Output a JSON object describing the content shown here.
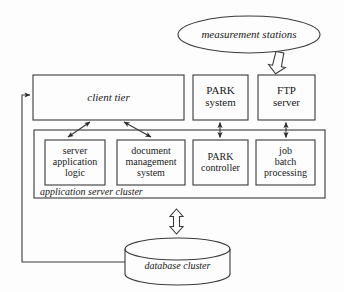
{
  "diagram": {
    "style": {
      "background": "#fdfdfd",
      "stroke": "#3a3a3a",
      "text": "#1a1a1a",
      "fill": "none"
    },
    "nodes": [
      {
        "id": "measurement-stations",
        "label": "measurement  stations",
        "shape": "ellipse",
        "italic": true,
        "x": 178,
        "y": 16,
        "w": 142,
        "h": 37
      },
      {
        "id": "client-tier",
        "label": "client tier",
        "shape": "rect",
        "italic": true,
        "x": 33,
        "y": 75,
        "w": 151,
        "h": 45
      },
      {
        "id": "park-system",
        "label": "PARK\nsystem",
        "line1": "PARK",
        "line2": "system",
        "shape": "rect",
        "italic": false,
        "x": 193,
        "y": 75,
        "w": 55,
        "h": 45
      },
      {
        "id": "ftp-server",
        "label": "FTP\nserver",
        "line1": "FTP",
        "line2": "server",
        "shape": "rect",
        "italic": false,
        "x": 258,
        "y": 75,
        "w": 57,
        "h": 45
      },
      {
        "id": "application-server-cluster",
        "label": "application server cluster",
        "shape": "rect",
        "italic": true,
        "x": 34,
        "y": 130,
        "w": 291,
        "h": 68
      },
      {
        "id": "server-application-logic",
        "label": "server application logic",
        "line1": "server",
        "line2": "application",
        "line3": "logic",
        "shape": "rect",
        "italic": false,
        "x": 45,
        "y": 140,
        "w": 60,
        "h": 45
      },
      {
        "id": "document-management-system",
        "label": "document management system",
        "line1": "document",
        "line2": "management",
        "line3": "system",
        "shape": "rect",
        "italic": false,
        "x": 117,
        "y": 140,
        "w": 68,
        "h": 45
      },
      {
        "id": "park-controller",
        "label": "PARK controller",
        "line1": "PARK",
        "line2": "controller",
        "shape": "rect",
        "italic": false,
        "x": 193,
        "y": 140,
        "w": 55,
        "h": 45
      },
      {
        "id": "job-batch-processing",
        "label": "job batch processing",
        "line1": "job",
        "line2": "batch",
        "line3": "processing",
        "shape": "rect",
        "italic": false,
        "x": 256,
        "y": 140,
        "w": 59,
        "h": 45
      },
      {
        "id": "database-cluster",
        "label": "database cluster",
        "shape": "cylinder",
        "italic": true,
        "x": 125,
        "y": 238,
        "w": 105,
        "h": 47
      }
    ],
    "connectors": [
      {
        "id": "stations-to-ftp",
        "type": "block-arrow",
        "direction": "down",
        "from": "measurement-stations",
        "to": "ftp-server"
      },
      {
        "id": "cluster-to-database",
        "type": "block-arrow",
        "direction": "both",
        "from": "application-server-cluster",
        "to": "database-cluster"
      },
      {
        "id": "client-to-server-logic",
        "type": "line-arrow",
        "direction": "both",
        "from": "client-tier",
        "to": "server-application-logic"
      },
      {
        "id": "client-to-document-management",
        "type": "line-arrow",
        "direction": "both",
        "from": "client-tier",
        "to": "document-management-system"
      },
      {
        "id": "park-system-to-park-controller",
        "type": "line-arrow",
        "direction": "both",
        "from": "park-system",
        "to": "park-controller"
      },
      {
        "id": "ftp-to-job-batch",
        "type": "line-arrow",
        "direction": "both",
        "from": "ftp-server",
        "to": "job-batch-processing"
      },
      {
        "id": "database-to-client-tier",
        "type": "line-arrow",
        "direction": "single",
        "from": "database-cluster",
        "to": "client-tier"
      }
    ]
  }
}
